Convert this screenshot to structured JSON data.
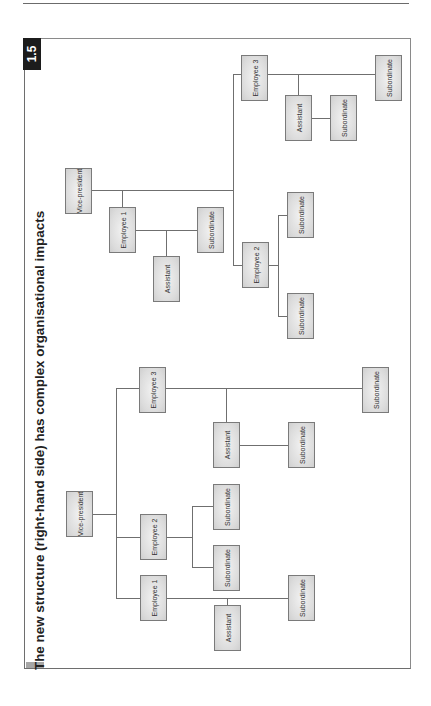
{
  "figure": {
    "number": "1.5",
    "title": "The new structure (right-hand side) has complex organisational impacts"
  },
  "colors": {
    "tab_bg": "#1c1c1c",
    "box_border": "#7a7a7a",
    "box_fill": "#dcdcdc",
    "line": "#6f6f6f",
    "frame": "#8a8a8a"
  },
  "left_structure": {
    "root": "Vice-president",
    "employees": [
      {
        "label": "Employee 1",
        "assistant": "Assistant",
        "subordinates": [
          "Subordinate"
        ]
      },
      {
        "label": "Employee 2",
        "subordinates": [
          "Subordinate",
          "Subordinate"
        ]
      },
      {
        "label": "Employee 3",
        "assistant": "Assistant",
        "assistant_subordinates": [
          "Subordinate"
        ],
        "subordinates": [
          "Subordinate"
        ]
      }
    ]
  },
  "right_structure": {
    "root": "Vice-president",
    "employees": [
      {
        "label": "Employee 1",
        "assistant": "Assistant",
        "subordinates": [
          "Subordinate"
        ]
      },
      {
        "label": "Employee 2",
        "subordinates": [
          "Subordinate",
          "Subordinate"
        ]
      },
      {
        "label": "Employee 3",
        "assistant": "Assistant",
        "assistant_subordinates": [
          "Subordinate"
        ],
        "subordinates": [
          "Subordinate"
        ]
      }
    ]
  }
}
